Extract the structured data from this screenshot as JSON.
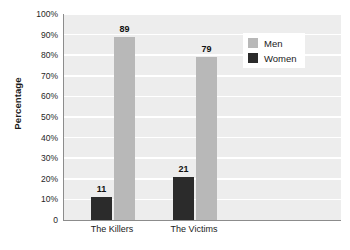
{
  "chart_data": {
    "type": "bar",
    "title": "",
    "xlabel": "",
    "ylabel": "Percentage",
    "ylim": [
      0,
      100
    ],
    "grid": true,
    "legend_position": "top-right",
    "categories": [
      "The Killers",
      "The Victims"
    ],
    "series": [
      {
        "name": "Men",
        "values": [
          89,
          79
        ],
        "color": "#b8b8b8"
      },
      {
        "name": "Women",
        "values": [
          11,
          21
        ],
        "color": "#2b2b2b"
      }
    ],
    "y_ticks": [
      {
        "value": 100,
        "label": "100%"
      },
      {
        "value": 90,
        "label": "90%"
      },
      {
        "value": 80,
        "label": "80%"
      },
      {
        "value": 70,
        "label": "70%"
      },
      {
        "value": 60,
        "label": "60%"
      },
      {
        "value": 50,
        "label": "50%"
      },
      {
        "value": 40,
        "label": "40%"
      },
      {
        "value": 30,
        "label": "30%"
      },
      {
        "value": 20,
        "label": "20%"
      },
      {
        "value": 10,
        "label": "10%"
      },
      {
        "value": 0,
        "label": "0"
      }
    ],
    "data_labels": [
      "11",
      "89",
      "21",
      "79"
    ],
    "plot_background": "#ededed",
    "gridline_color": "#ffffff",
    "axis_color": "#8c8c8c"
  }
}
